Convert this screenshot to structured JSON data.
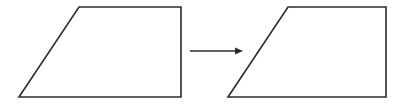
{
  "canvas": {
    "width": 406,
    "height": 105,
    "background_color": "#ffffff",
    "stroke_color": "#2b2b2b",
    "stroke_width": 1.6
  },
  "diagram": {
    "title": "",
    "type": "shape-transformation"
  },
  "shapes": [
    {
      "name": "left-trapezoid",
      "label": "",
      "kind": "right-trapezoid",
      "points": "79,7 181,7 181,97 19,97",
      "vertices": [
        {
          "name": "top-left",
          "x": 79,
          "y": 7
        },
        {
          "name": "top-right",
          "x": 181,
          "y": 7
        },
        {
          "name": "bottom-right",
          "x": 181,
          "y": 97
        },
        {
          "name": "bottom-left",
          "x": 19,
          "y": 97
        }
      ],
      "top_width": 102,
      "bottom_width": 162,
      "height": 90
    },
    {
      "name": "right-trapezoid",
      "label": "",
      "kind": "right-trapezoid",
      "points": "288,7 386,7 386,97 228,97",
      "vertices": [
        {
          "name": "top-left",
          "x": 288,
          "y": 7
        },
        {
          "name": "top-right",
          "x": 386,
          "y": 7
        },
        {
          "name": "bottom-right",
          "x": 386,
          "y": 97
        },
        {
          "name": "bottom-left",
          "x": 228,
          "y": 97
        }
      ],
      "top_width": 98,
      "bottom_width": 158,
      "height": 90
    }
  ],
  "arrow": {
    "name": "transformation-arrow",
    "label": "",
    "direction": "right",
    "shaft_x1": 190,
    "shaft_y1": 51,
    "shaft_x2": 238,
    "shaft_y2": 51,
    "head_points": "243,51 235,47.5 235,54.5",
    "color": "#2b2b2b"
  }
}
